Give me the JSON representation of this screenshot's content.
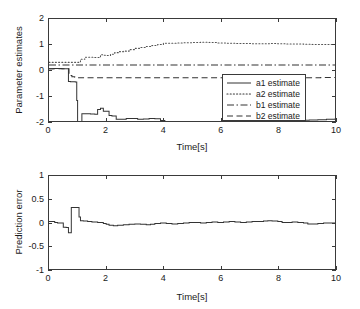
{
  "chart_data": [
    {
      "type": "line",
      "id": "parameter-estimates",
      "title": "",
      "xlabel": "Time[s]",
      "ylabel": "Parameter estimates",
      "xlim": [
        0,
        10
      ],
      "ylim": [
        -2,
        2
      ],
      "xticks": [
        0,
        2,
        4,
        6,
        8,
        10
      ],
      "yticks": [
        2,
        1,
        0,
        -1,
        -2
      ],
      "grid": false,
      "legend_position": "lower right",
      "series": [
        {
          "name": "a1 estimate",
          "style": "solid",
          "color": "#333333",
          "x": [
            0,
            0.15,
            0.3,
            0.45,
            0.6,
            0.68,
            0.75,
            0.85,
            0.92,
            0.97,
            1.0,
            1.05,
            1.15,
            1.3,
            1.45,
            1.6,
            1.7,
            1.8,
            1.9,
            2.0,
            2.1,
            2.2,
            2.35,
            2.5,
            2.7,
            2.9,
            3.1,
            3.3,
            3.5,
            3.7,
            3.9,
            4.05,
            4.2,
            4.4,
            4.6,
            4.8,
            5.0,
            5.2,
            5.5,
            5.8,
            6.1,
            6.4,
            6.7,
            7.0,
            7.3,
            7.6,
            7.9,
            8.2,
            8.5,
            8.75,
            8.9,
            9.1,
            9.4,
            9.7,
            10
          ],
          "y": [
            0.05,
            0.06,
            0.06,
            0.05,
            0.05,
            -0.45,
            -0.46,
            -0.46,
            -0.47,
            -1.2,
            -2.2,
            -2.18,
            -1.72,
            -1.72,
            -1.73,
            -1.74,
            -1.55,
            -1.5,
            -1.62,
            -1.62,
            -1.78,
            -1.8,
            -1.93,
            -1.93,
            -1.9,
            -1.9,
            -1.93,
            -1.92,
            -1.9,
            -1.91,
            -1.98,
            -2.1,
            -2.08,
            -2.06,
            -2.05,
            -2.07,
            -2.06,
            -2.03,
            -2.05,
            -2.04,
            -2.06,
            -2.05,
            -2.04,
            -2.05,
            -2.03,
            -2.04,
            -2.05,
            -2.04,
            -2.05,
            -2.06,
            -1.97,
            -1.96,
            -1.95,
            -1.93,
            -1.9
          ]
        },
        {
          "name": "a2 estimate",
          "style": "dotted",
          "color": "#555555",
          "x": [
            0,
            0.3,
            0.6,
            0.7,
            0.85,
            1.0,
            1.1,
            1.25,
            1.4,
            1.55,
            1.7,
            1.8,
            1.9,
            2.0,
            2.15,
            2.3,
            2.45,
            2.6,
            2.8,
            3.0,
            3.2,
            3.4,
            3.6,
            3.8,
            4.0,
            4.2,
            4.45,
            4.7,
            5.0,
            5.3,
            5.6,
            5.9,
            6.2,
            6.5,
            6.8,
            7.1,
            7.4,
            7.7,
            8.0,
            8.3,
            8.6,
            8.9,
            9.2,
            9.5,
            9.75,
            10
          ],
          "y": [
            0.3,
            0.3,
            0.3,
            0.3,
            0.3,
            0.3,
            0.42,
            0.5,
            0.5,
            0.49,
            0.49,
            0.6,
            0.58,
            0.57,
            0.62,
            0.68,
            0.72,
            0.74,
            0.8,
            0.85,
            0.88,
            0.92,
            0.96,
            1.0,
            1.05,
            1.05,
            1.06,
            1.07,
            1.08,
            1.09,
            1.08,
            1.06,
            1.05,
            1.04,
            1.04,
            1.03,
            1.03,
            1.04,
            1.03,
            1.02,
            1.02,
            1.01,
            1.0,
            1.0,
            1.0,
            1.0
          ]
        },
        {
          "name": "b1 estimate",
          "style": "dashdot",
          "color": "#333333",
          "x": [
            0,
            0.5,
            0.8,
            1.0,
            1.5,
            2.0,
            3.0,
            4.0,
            5.0,
            6.0,
            7.0,
            8.0,
            9.0,
            10
          ],
          "y": [
            0.2,
            0.2,
            0.2,
            0.2,
            0.2,
            0.2,
            0.2,
            0.2,
            0.2,
            0.2,
            0.2,
            0.2,
            0.2,
            0.2
          ]
        },
        {
          "name": "b2 estimate",
          "style": "dashed",
          "color": "#333333",
          "x": [
            0,
            0.3,
            0.6,
            0.7,
            0.8,
            0.9,
            1.0,
            1.3,
            1.6,
            2.0,
            2.5,
            3.0,
            3.5,
            4.0,
            5.0,
            6.0,
            7.0,
            8.0,
            9.0,
            9.5,
            10
          ],
          "y": [
            0.05,
            0.05,
            0.05,
            -0.22,
            -0.26,
            -0.28,
            -0.3,
            -0.3,
            -0.3,
            -0.3,
            -0.3,
            -0.3,
            -0.3,
            -0.3,
            -0.3,
            -0.3,
            -0.3,
            -0.3,
            -0.3,
            -0.29,
            -0.27
          ]
        }
      ]
    },
    {
      "type": "line",
      "id": "prediction-error",
      "title": "",
      "xlabel": "Time[s]",
      "ylabel": "Prediction error",
      "xlim": [
        0,
        10
      ],
      "ylim": [
        -1,
        1
      ],
      "xticks": [
        0,
        2,
        4,
        6,
        8,
        10
      ],
      "yticks": [
        1,
        0.5,
        0,
        -0.5,
        -1
      ],
      "grid": false,
      "series": [
        {
          "name": "prediction error",
          "style": "solid",
          "color": "#333333",
          "x": [
            0,
            0.12,
            0.2,
            0.3,
            0.42,
            0.5,
            0.6,
            0.68,
            0.72,
            0.78,
            0.85,
            0.95,
            1.0,
            1.05,
            1.1,
            1.2,
            1.35,
            1.5,
            1.7,
            1.9,
            2.0,
            2.1,
            2.25,
            2.4,
            2.6,
            2.8,
            3.0,
            3.2,
            3.4,
            3.55,
            3.7,
            3.9,
            4.1,
            4.3,
            4.5,
            4.7,
            4.9,
            5.1,
            5.3,
            5.5,
            5.7,
            5.9,
            6.1,
            6.3,
            6.5,
            6.7,
            6.9,
            7.1,
            7.3,
            7.5,
            7.65,
            7.8,
            8.0,
            8.15,
            8.3,
            8.5,
            8.7,
            8.9,
            9.05,
            9.2,
            9.4,
            9.6,
            9.8,
            10
          ],
          "y": [
            0.02,
            0.02,
            0.0,
            -0.01,
            -0.01,
            -0.1,
            -0.11,
            -0.22,
            -0.22,
            0.32,
            0.32,
            0.32,
            0.32,
            0.12,
            0.04,
            0.03,
            0.02,
            0.01,
            0.0,
            -0.02,
            -0.04,
            -0.06,
            -0.07,
            -0.06,
            -0.05,
            -0.04,
            -0.03,
            -0.04,
            -0.05,
            -0.04,
            -0.02,
            -0.01,
            -0.02,
            -0.03,
            -0.02,
            -0.01,
            0.0,
            0.0,
            -0.01,
            0.0,
            0.01,
            0.0,
            0.01,
            0.02,
            0.01,
            0.0,
            0.01,
            0.02,
            0.02,
            0.03,
            0.04,
            0.03,
            0.02,
            0.0,
            0.0,
            0.01,
            0.0,
            -0.01,
            -0.03,
            -0.03,
            -0.02,
            -0.01,
            -0.01,
            0.0
          ]
        }
      ]
    }
  ],
  "top_panel": {
    "ylabel": "Parameter estimates",
    "xlabel": "Time[s]",
    "yticklabels": [
      "2",
      "1",
      "0",
      "-1",
      "-2"
    ],
    "xticklabels": [
      "0",
      "2",
      "4",
      "6",
      "8",
      "10"
    ],
    "legend": {
      "items": [
        {
          "label": "a1 estimate",
          "key": "solid-line-key"
        },
        {
          "label": "a2 estimate",
          "key": "dotted-line-key"
        },
        {
          "label": "b1 estimate",
          "key": "dashdot-line-key"
        },
        {
          "label": "b2 estimate",
          "key": "dashed-line-key"
        }
      ]
    }
  },
  "bottom_panel": {
    "ylabel": "Prediction error",
    "xlabel": "Time[s]",
    "yticklabels": [
      "1",
      "0.5",
      "0",
      "-0.5",
      "-1"
    ],
    "xticklabels": [
      "0",
      "2",
      "4",
      "6",
      "8",
      "10"
    ]
  }
}
